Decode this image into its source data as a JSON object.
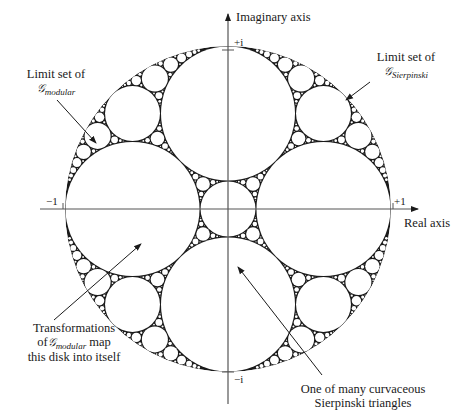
{
  "figure": {
    "axes": {
      "imaginary_label": "Imaginary axis",
      "real_label": "Real axis",
      "tick_plus_i": "+i",
      "tick_minus_i": "−i",
      "tick_minus_1": "−1",
      "tick_plus_1": "+1"
    },
    "annotations": {
      "modular_limit": {
        "line1": "Limit set of",
        "symbol": "𝒢",
        "subscript": "modular"
      },
      "sierpinski_limit": {
        "line1": "Limit set of",
        "symbol": "𝒢",
        "subscript": "Sierpinski"
      },
      "disk_transform": {
        "line1": "Transformations",
        "line2_prefix": "of",
        "symbol": "𝒢",
        "subscript": "modular",
        "line2_suffix": "map",
        "line3": "this disk into itself"
      },
      "sierpinski_triangle": {
        "line1": "One of many curvaceous",
        "line2": "Sierpinski triangles"
      }
    },
    "geometry": {
      "center": [
        228,
        209
      ],
      "radius": 163,
      "ink_color": "#1a1a1a",
      "axis_color": "#555555"
    }
  }
}
